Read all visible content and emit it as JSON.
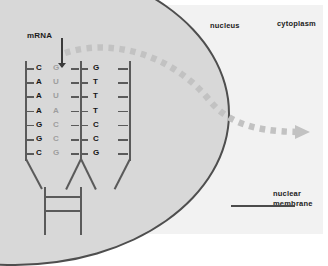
{
  "diagram": {
    "labels": {
      "mrna": "mRNA",
      "nucleus": "nucleus",
      "cytoplasm": "cytoplasm",
      "nuclear_membrane_line1": "nuclear",
      "nuclear_membrane_line2": "membrane"
    },
    "colors": {
      "panel_bg": "#f2f2f2",
      "nucleus_fill": "#d8d8d8",
      "membrane_stroke": "#4e4e4e",
      "strand_stroke": "#5a5a5a",
      "text": "#151515",
      "faded_base": "#9e9e9e",
      "arrow": "#c2c2c2"
    },
    "base_pairs": [
      {
        "mrna": "C",
        "template": "G",
        "coding": "G"
      },
      {
        "mrna": "A",
        "template": "U",
        "coding": "T"
      },
      {
        "mrna": "A",
        "template": "U",
        "coding": "T"
      },
      {
        "mrna": "A",
        "template": "A",
        "coding": "T"
      },
      {
        "mrna": "G",
        "template": "C",
        "coding": "C"
      },
      {
        "mrna": "G",
        "template": "C",
        "coding": "C"
      },
      {
        "mrna": "C",
        "template": "G",
        "coding": "G"
      }
    ],
    "export_arrow": {
      "name": "mrna-export-arrow",
      "style": "dashed-curved",
      "direction": "nucleus-to-cytoplasm"
    }
  }
}
